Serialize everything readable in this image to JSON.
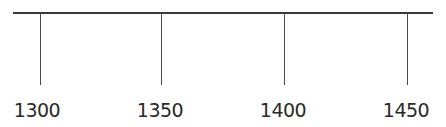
{
  "timeline": {
    "axis_color": "#3a3a3a",
    "ticks": [
      {
        "label": "1300",
        "x": 40
      },
      {
        "label": "1350",
        "x": 161
      },
      {
        "label": "1400",
        "x": 284
      },
      {
        "label": "1450",
        "x": 407
      }
    ]
  }
}
